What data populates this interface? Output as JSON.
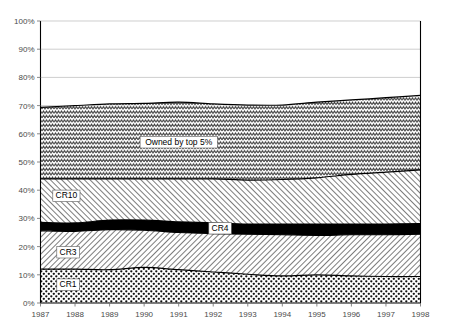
{
  "chart_data": {
    "type": "area",
    "stacked": true,
    "title": "",
    "xlabel": "",
    "ylabel": "",
    "ylim": [
      0,
      100
    ],
    "ytick_labels": [
      "0%",
      "10%",
      "20%",
      "30%",
      "40%",
      "50%",
      "60%",
      "70%",
      "80%",
      "90%",
      "100%"
    ],
    "ytick_values": [
      0,
      10,
      20,
      30,
      40,
      50,
      60,
      70,
      80,
      90,
      100
    ],
    "grid": true,
    "legend_position": "inline-annotations",
    "categories": [
      "1987",
      "1988",
      "1989",
      "1990",
      "1991",
      "1992",
      "1993",
      "1994",
      "1995",
      "1996",
      "1997",
      "1998"
    ],
    "x": [
      1987,
      1988,
      1989,
      1990,
      1991,
      1992,
      1993,
      1994,
      1995,
      1996,
      1997,
      1998
    ],
    "series": [
      {
        "name": "CR1",
        "label": "CR1",
        "pattern": "dense-dots",
        "values": [
          12.0,
          12.0,
          11.8,
          12.6,
          11.8,
          11.0,
          10.2,
          9.6,
          10.0,
          9.6,
          9.4,
          9.4
        ]
      },
      {
        "name": "CR3",
        "label": "CR3",
        "pattern": "diagonal-hatch-right",
        "values": [
          13.6,
          13.4,
          14.2,
          13.2,
          13.2,
          13.6,
          14.2,
          14.6,
          14.0,
          14.6,
          14.8,
          15.0
        ]
      },
      {
        "name": "CR4",
        "label": "CR4",
        "pattern": "solid-black",
        "values": [
          3.0,
          3.0,
          3.4,
          3.6,
          3.8,
          3.8,
          3.6,
          3.8,
          4.0,
          3.8,
          3.8,
          3.8
        ]
      },
      {
        "name": "CR10",
        "label": "CR10",
        "pattern": "diagonal-hatch-left",
        "values": [
          15.4,
          15.6,
          14.6,
          14.6,
          15.2,
          15.6,
          15.6,
          15.8,
          16.4,
          17.6,
          18.4,
          19.0
        ]
      },
      {
        "name": "Owned by top 5%",
        "label": "Owned by top 5%",
        "pattern": "wave-zigzag",
        "values": [
          25.4,
          26.0,
          26.6,
          26.8,
          27.2,
          26.6,
          26.6,
          26.4,
          26.8,
          26.4,
          26.4,
          26.4
        ]
      }
    ],
    "cumulative_tops": {
      "CR1": [
        12.0,
        12.0,
        11.8,
        12.6,
        11.8,
        11.0,
        10.2,
        9.6,
        10.0,
        9.6,
        9.4,
        9.4
      ],
      "CR3": [
        25.6,
        25.4,
        26.0,
        25.8,
        25.0,
        24.6,
        24.4,
        24.2,
        24.0,
        24.2,
        24.2,
        24.4
      ],
      "CR4": [
        28.6,
        28.4,
        29.4,
        29.4,
        28.8,
        28.4,
        28.0,
        28.0,
        28.0,
        28.0,
        28.0,
        28.2
      ],
      "CR10": [
        44.0,
        44.0,
        44.0,
        44.0,
        44.0,
        44.0,
        43.6,
        43.8,
        44.4,
        45.6,
        46.4,
        47.2
      ],
      "Top 5%": [
        69.4,
        70.0,
        70.6,
        70.8,
        71.2,
        70.6,
        70.2,
        70.2,
        71.2,
        72.0,
        72.8,
        73.6
      ]
    },
    "annotations": [
      {
        "text": "Owned by top 5%",
        "x": 1991.0,
        "y": 57.0
      },
      {
        "text": "CR10",
        "x": 1987.75,
        "y": 38.0
      },
      {
        "text": "CR4",
        "x": 1992.2,
        "y": 26.5
      },
      {
        "text": "CR3",
        "x": 1987.8,
        "y": 18.0
      },
      {
        "text": "CR1",
        "x": 1987.8,
        "y": 6.5
      }
    ],
    "colors": {
      "axis": "#000000",
      "grid": "#b9b9b9",
      "tick_text": "#4a4a4a",
      "cr4_fill": "#000000",
      "background": "#ffffff"
    }
  }
}
